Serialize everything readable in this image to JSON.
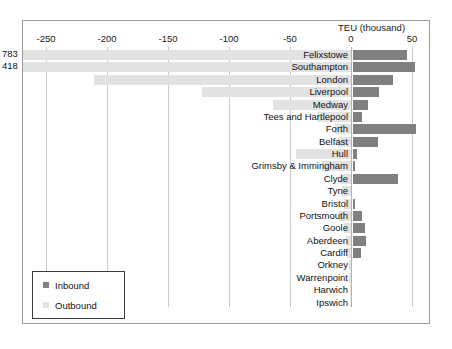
{
  "chart_data": {
    "type": "bar",
    "title": "",
    "axis_title": "TEU (thousand)",
    "orientation": "horizontal",
    "layout": "diverging",
    "xlabel": "TEU (thousand)",
    "ylabel": "",
    "xlim": [
      -260,
      55
    ],
    "grid": true,
    "legend_position": "bottom-left",
    "xticks": [
      {
        "label": "-250",
        "value": -250
      },
      {
        "label": "-200",
        "value": -200
      },
      {
        "label": "-150",
        "value": -150
      },
      {
        "label": "-100",
        "value": -100
      },
      {
        "label": "-50",
        "value": -50
      },
      {
        "label": "0",
        "value": 0
      },
      {
        "label": "50",
        "value": 50
      }
    ],
    "categories": [
      "Felixstowe",
      "Southampton",
      "London",
      "Liverpool",
      "Medway",
      "Tees and Hartlepool",
      "Forth",
      "Belfast",
      "Hull",
      "Grimsby & Immingham",
      "Clyde",
      "Tyne",
      "Bristol",
      "Portsmouth",
      "Goole",
      "Aberdeen",
      "Cardiff",
      "Orkney",
      "Warrenpoint",
      "Harwich",
      "Ipswich"
    ],
    "series": [
      {
        "name": "Outbound",
        "color": "#e2e2e2",
        "values": [
          -783,
          -418,
          -211,
          -122,
          -64,
          -28,
          -13,
          -11,
          -45,
          -24,
          -9,
          -7,
          -6,
          -10,
          -6,
          -4,
          -3,
          -2,
          -2,
          -1,
          -1
        ]
      },
      {
        "name": "Inbound",
        "color": "#808080",
        "values": [
          45,
          51,
          33,
          22,
          13,
          8,
          52,
          21,
          4,
          2,
          37,
          0,
          2,
          8,
          10,
          11,
          7,
          0,
          0,
          0,
          0
        ]
      }
    ],
    "annotations": [
      {
        "label": "783",
        "category": "Felixstowe",
        "note": "outbound value clipped at axis"
      },
      {
        "label": "418",
        "category": "Southampton",
        "note": "outbound value clipped at axis"
      }
    ]
  },
  "legend": {
    "items": [
      {
        "label": "Inbound",
        "color": "#808080"
      },
      {
        "label": "Outbound",
        "color": "#e2e2e2"
      }
    ]
  }
}
